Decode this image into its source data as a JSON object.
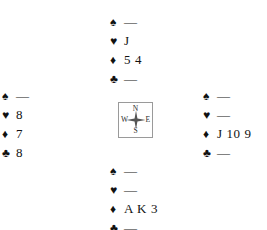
{
  "diagram": {
    "type": "bridge-deal-diagram",
    "suit_symbols": {
      "spade": "♠",
      "heart": "♥",
      "diamond": "♦",
      "club": "♣"
    },
    "void_mark": "—",
    "hands": {
      "north": {
        "label": "North",
        "spades": "—",
        "hearts": "J",
        "diamonds": "5 4",
        "clubs": "—"
      },
      "west": {
        "label": "West",
        "spades": "—",
        "hearts": "8",
        "diamonds": "7",
        "clubs": "8"
      },
      "east": {
        "label": "East",
        "spades": "—",
        "hearts": "—",
        "diamonds": "J 10 9",
        "clubs": "—"
      },
      "south": {
        "label": "South",
        "spades": "—",
        "hearts": "—",
        "diamonds": "A K 3",
        "clubs": "—"
      }
    },
    "compass": {
      "north": "N",
      "west": "W",
      "east": "E",
      "south": "S"
    },
    "colors": {
      "ink": "#111111",
      "compass_border": "#9a9a9a",
      "background": "#ffffff"
    }
  }
}
